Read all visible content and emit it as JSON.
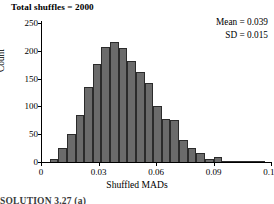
{
  "title": "Total shuffles = 2000",
  "annotations": {
    "mean": "Mean = 0.039",
    "sd": "SD = 0.015"
  },
  "footer_partial": "SOLUTION 3.27 (a)",
  "colors": {
    "bar_fill": "#6b6b6b",
    "bar_edge": "#2b2b2b",
    "axis": "#000000",
    "background": "#ffffff"
  },
  "chart_data": {
    "type": "bar",
    "title": "Total shuffles = 2000",
    "xlabel": "Shuffled MADs",
    "ylabel": "Count",
    "xlim": [
      0,
      0.12
    ],
    "ylim": [
      0,
      250
    ],
    "grid": false,
    "legend": null,
    "bin_width": 0.0045,
    "xticks": [
      0,
      0.03,
      0.06,
      0.09,
      0.12
    ],
    "xtick_labels": [
      "0",
      "0.03",
      "0.06",
      "0.09",
      "0.12"
    ],
    "yticks": [
      0,
      50,
      100,
      150,
      200,
      250
    ],
    "ytick_labels": [
      "0",
      "50",
      "100",
      "150",
      "200",
      "250"
    ],
    "bin_starts": [
      0.0045,
      0.009,
      0.0135,
      0.018,
      0.0225,
      0.027,
      0.0315,
      0.036,
      0.0405,
      0.045,
      0.0495,
      0.054,
      0.0585,
      0.063,
      0.0675,
      0.072,
      0.0765,
      0.081,
      0.0855,
      0.09,
      0.0945,
      0.099,
      0.1035,
      0.108,
      0.1125
    ],
    "values": [
      5,
      26,
      50,
      84,
      135,
      176,
      207,
      216,
      205,
      181,
      161,
      143,
      101,
      78,
      75,
      39,
      25,
      16,
      6,
      9,
      2,
      1,
      1,
      2,
      1
    ],
    "annotations": [
      "Mean = 0.039",
      "SD = 0.015"
    ]
  }
}
